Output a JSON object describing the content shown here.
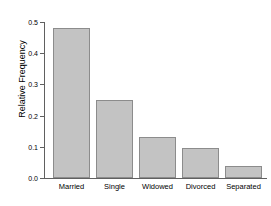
{
  "chart_data": {
    "type": "bar",
    "title": "",
    "xlabel": "",
    "ylabel": "Relative Frequency",
    "categories": [
      "Married",
      "Single",
      "Widowed",
      "Divorced",
      "Separated"
    ],
    "values": [
      0.48,
      0.25,
      0.13,
      0.095,
      0.04
    ],
    "ylim": [
      0.0,
      0.5
    ],
    "yticks": [
      0.0,
      0.1,
      0.2,
      0.3,
      0.4,
      0.5
    ],
    "ytick_labels": [
      "0.0",
      "0.1",
      "0.2",
      "0.3",
      "0.4",
      "0.5"
    ],
    "grid": false,
    "legend": false,
    "bar_fill_color": "#c3c3c3",
    "bar_border_color": "#8c8c8c",
    "axis_color": "#606060",
    "background_color": "#ffffff"
  }
}
